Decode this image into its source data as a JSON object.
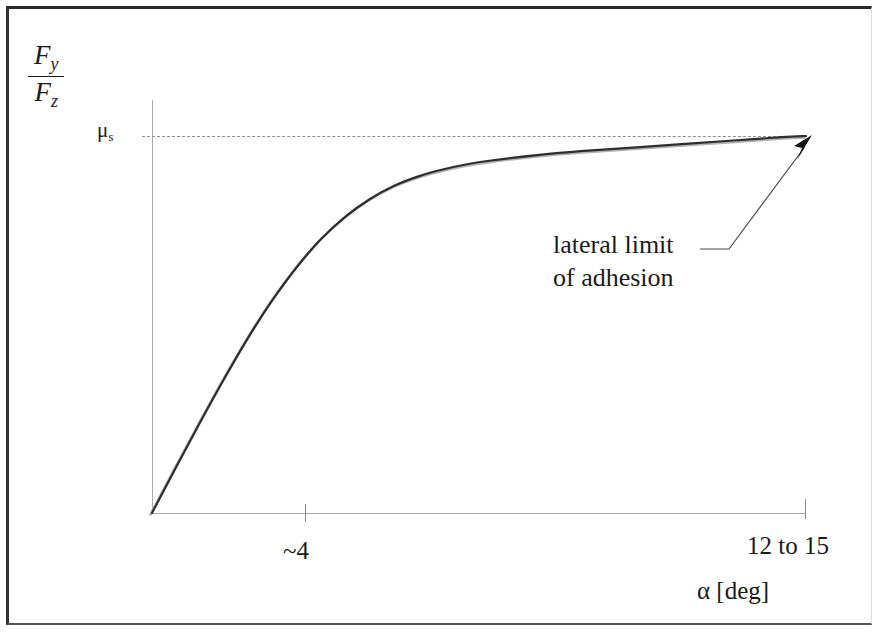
{
  "figure": {
    "background_color": "#ffffff",
    "frame_color": "#2a2a2a"
  },
  "axes": {
    "y_label_numerator": "F",
    "y_label_numerator_sub": "y",
    "y_label_denominator": "F",
    "y_label_denominator_sub": "z",
    "x_label": "α [deg]",
    "asymptote_label": "μ",
    "asymptote_label_sub": "s",
    "axis_color": "#a9a9a9",
    "dash_color": "#8f8f8f"
  },
  "ticks": {
    "x": [
      {
        "label": "~4",
        "value": 4
      },
      {
        "label": "12 to 15",
        "value": 13.5
      }
    ]
  },
  "annotation": {
    "line1": "lateral limit",
    "line2": "of adhesion",
    "leader_color": "#3a3a3a",
    "arrow_color": "#161616"
  },
  "chart_data": {
    "type": "line",
    "title": "",
    "subtitle": "",
    "xlabel": "α [deg]",
    "ylabel": "Fy / Fz",
    "xlim": [
      0,
      13.5
    ],
    "ylim": [
      0,
      1.06
    ],
    "grid": false,
    "legend_position": "none",
    "x_tick_labels": [
      "~4",
      "12 to 15"
    ],
    "x_tick_values": [
      4,
      13.5
    ],
    "y_tick_labels": [
      "μs"
    ],
    "y_tick_values": [
      1.0
    ],
    "annotations": [
      {
        "text": "lateral limit of adhesion",
        "points_to_x": 13.5,
        "points_to_y": 1.0
      }
    ],
    "reference_lines": [
      {
        "orientation": "horizontal",
        "value": 1.0,
        "style": "dashed",
        "label": "μs"
      }
    ],
    "series": [
      {
        "name": "lateral force ratio",
        "x": [
          0.0,
          0.5,
          1.0,
          1.5,
          2.0,
          2.5,
          3.0,
          3.5,
          4.0,
          4.5,
          5.0,
          5.5,
          6.0,
          6.5,
          7.0,
          8.0,
          9.0,
          10.0,
          11.0,
          12.0,
          13.0,
          13.5
        ],
        "y": [
          0.0,
          0.122,
          0.242,
          0.358,
          0.468,
          0.567,
          0.654,
          0.728,
          0.787,
          0.833,
          0.868,
          0.893,
          0.911,
          0.925,
          0.935,
          0.95,
          0.961,
          0.97,
          0.979,
          0.988,
          0.997,
          1.0
        ]
      }
    ]
  }
}
